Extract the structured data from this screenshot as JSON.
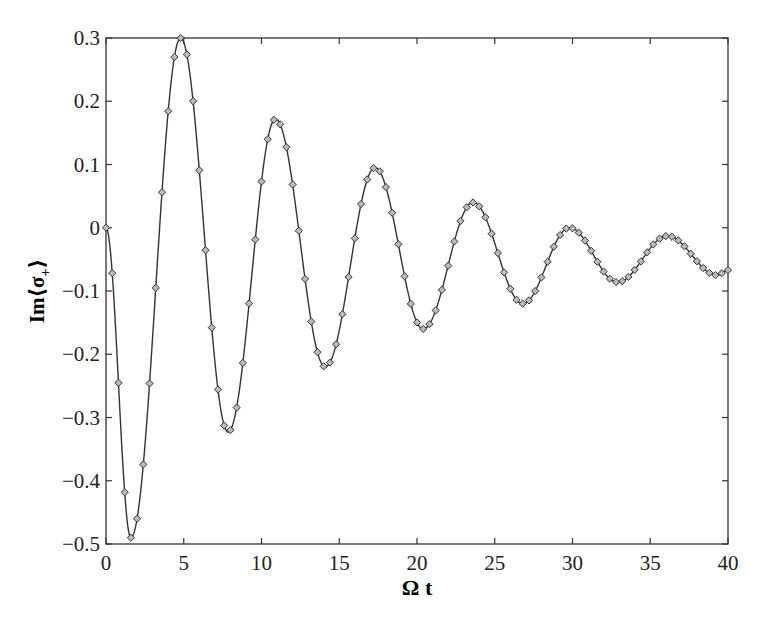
{
  "chart_data": {
    "type": "line",
    "title": "",
    "xlabel": "Ω t",
    "ylabel": "Im⟨σ₊⟩",
    "xlim": [
      0,
      40
    ],
    "ylim": [
      -0.5,
      0.3
    ],
    "xticks": [
      "0",
      "5",
      "10",
      "15",
      "20",
      "25",
      "30",
      "35",
      "40"
    ],
    "yticks": [
      "-0.5",
      "-0.4",
      "-0.3",
      "-0.2",
      "-0.1",
      "0",
      "0.1",
      "0.2",
      "0.3"
    ],
    "grid": false,
    "legend": null,
    "series": [
      {
        "name": "solid line (theory)",
        "style": "line",
        "extrema": [
          {
            "t": 0.0,
            "y": 0.0
          },
          {
            "t": 1.6,
            "y": -0.49
          },
          {
            "t": 4.8,
            "y": 0.3
          },
          {
            "t": 7.85,
            "y": -0.323
          },
          {
            "t": 10.9,
            "y": 0.172
          },
          {
            "t": 14.1,
            "y": -0.22
          },
          {
            "t": 17.3,
            "y": 0.095
          },
          {
            "t": 20.4,
            "y": -0.16
          },
          {
            "t": 23.6,
            "y": 0.04
          },
          {
            "t": 26.8,
            "y": -0.12
          },
          {
            "t": 29.8,
            "y": 0.0
          },
          {
            "t": 32.9,
            "y": -0.086
          },
          {
            "t": 36.1,
            "y": -0.013
          },
          {
            "t": 39.3,
            "y": -0.075
          },
          {
            "t": 40.0,
            "y": -0.067
          }
        ]
      },
      {
        "name": "diamond markers (numerical)",
        "style": "markers",
        "marker": "diamond",
        "marker_spacing_t": 0.4
      }
    ]
  }
}
